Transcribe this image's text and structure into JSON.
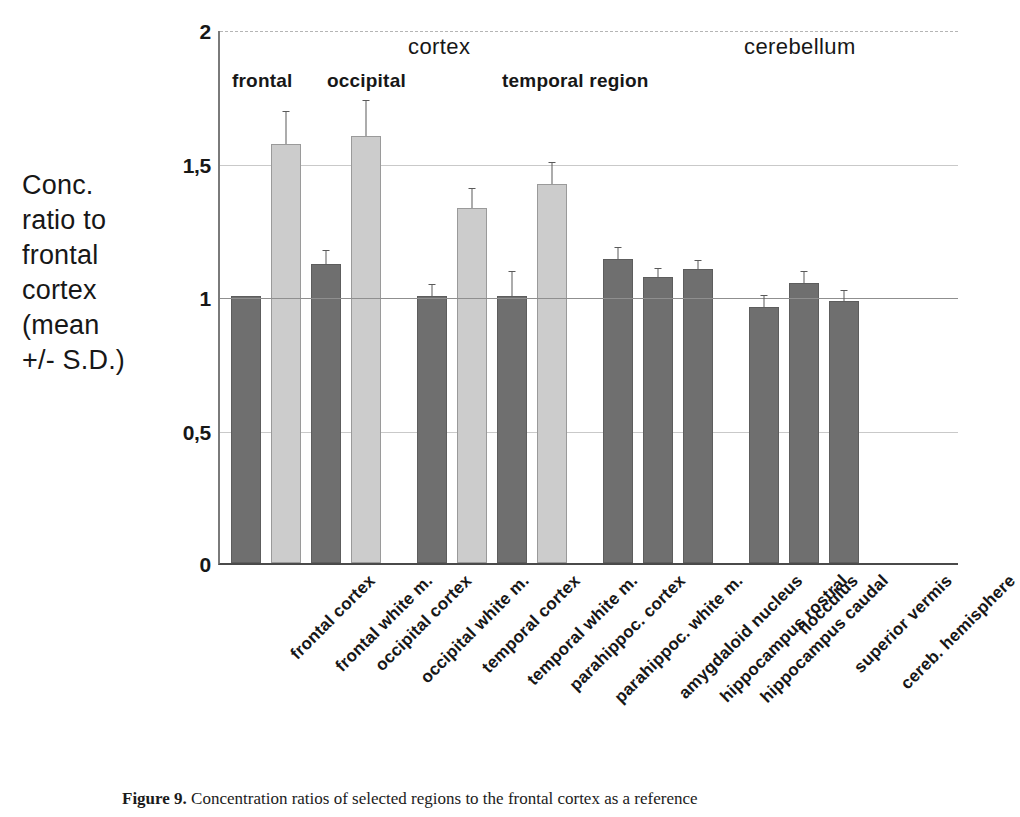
{
  "chart_data": {
    "type": "bar",
    "title": "",
    "xlabel": "",
    "ylabel": "Conc. ratio to frontal cortex (mean +/- S.D.)",
    "ylim": [
      0,
      2
    ],
    "yticks": [
      0,
      0.5,
      1,
      1.5,
      2
    ],
    "ytick_labels": [
      "0",
      "0,5",
      "1",
      "1,5",
      "2"
    ],
    "grid": true,
    "reference_line": 1,
    "legend": "none",
    "categories": [
      "frontal cortex",
      "frontal white m.",
      "occipital cortex",
      "occipital white m.",
      "temporal cortex",
      "temporal white m.",
      "parahippoc. cortex",
      "parahippoc. white m.",
      "amygdaloid nucleus",
      "hippocampus rostral",
      "hippocampus caudal",
      "flocculus",
      "superior vermis",
      "cereb. hemisphere"
    ],
    "values": [
      1.0,
      1.57,
      1.12,
      1.6,
      1.0,
      1.33,
      1.0,
      1.42,
      1.14,
      1.07,
      1.1,
      0.96,
      1.05,
      0.98
    ],
    "errors": [
      0.0,
      0.12,
      0.05,
      0.13,
      0.04,
      0.07,
      0.09,
      0.08,
      0.04,
      0.03,
      0.03,
      0.04,
      0.04,
      0.04
    ],
    "bar_kinds": [
      "dark",
      "light",
      "dark",
      "light",
      "dark",
      "light",
      "dark",
      "light",
      "dark",
      "dark",
      "dark",
      "dark",
      "dark",
      "dark"
    ],
    "colors": {
      "dark_bar": "#6f6f6f",
      "light_bar": "#cccccc",
      "axis": "#4a4a4a",
      "grid": "#c9c9c9",
      "text": "#171717"
    }
  },
  "headers": {
    "major": [
      {
        "label": "cortex"
      },
      {
        "label": "cerebellum"
      }
    ],
    "minor": [
      {
        "label": "frontal"
      },
      {
        "label": "occipital"
      },
      {
        "label": "temporal region"
      }
    ]
  },
  "y_axis_title_lines": [
    "Conc.",
    "ratio to",
    "frontal",
    "cortex",
    "(mean",
    "+/- S.D.)"
  ],
  "caption": {
    "figure_number": "Figure 9.",
    "text": "Concentration ratios of selected regions to the frontal cortex as a reference"
  }
}
